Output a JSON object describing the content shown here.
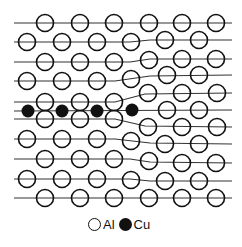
{
  "diagram": {
    "colors": {
      "line": "#333333",
      "atom_outline": "#111111",
      "al_fill": "#ffffff",
      "cu_fill": "#111111"
    },
    "atom_radius": 8.5,
    "cu_radius": 6.5,
    "lattice_lines": [
      {
        "points": [
          [
            14,
            23
          ],
          [
            232,
            23
          ]
        ]
      },
      {
        "points": [
          [
            14,
            42
          ],
          [
            130,
            42
          ],
          [
            150,
            40
          ],
          [
            232,
            40
          ]
        ]
      },
      {
        "points": [
          [
            14,
            62
          ],
          [
            130,
            62
          ],
          [
            150,
            59
          ],
          [
            232,
            59
          ]
        ]
      },
      {
        "points": [
          [
            14,
            81
          ],
          [
            115,
            81
          ],
          [
            150,
            76
          ],
          [
            232,
            75
          ]
        ]
      },
      {
        "points": [
          [
            14,
            102
          ],
          [
            115,
            102
          ],
          [
            145,
            94
          ],
          [
            232,
            93
          ]
        ]
      },
      {
        "points": [
          [
            14,
            111
          ],
          [
            232,
            110
          ]
        ]
      },
      {
        "points": [
          [
            14,
            119
          ],
          [
            115,
            119
          ],
          [
            145,
            126
          ],
          [
            232,
            127
          ]
        ]
      },
      {
        "points": [
          [
            14,
            139
          ],
          [
            115,
            139
          ],
          [
            150,
            143
          ],
          [
            232,
            144
          ]
        ]
      },
      {
        "points": [
          [
            14,
            159
          ],
          [
            130,
            159
          ],
          [
            150,
            162
          ],
          [
            232,
            163
          ]
        ]
      },
      {
        "points": [
          [
            14,
            179
          ],
          [
            130,
            179
          ],
          [
            150,
            181
          ],
          [
            232,
            181
          ]
        ]
      },
      {
        "points": [
          [
            14,
            198
          ],
          [
            232,
            198
          ]
        ]
      }
    ],
    "al_atoms": [
      [
        45,
        23
      ],
      [
        80,
        23
      ],
      [
        114,
        23
      ],
      [
        149,
        23
      ],
      [
        182,
        23
      ],
      [
        216,
        23
      ],
      [
        27,
        42
      ],
      [
        62,
        42
      ],
      [
        97,
        42
      ],
      [
        131,
        42
      ],
      [
        165,
        40
      ],
      [
        199,
        40
      ],
      [
        45,
        62
      ],
      [
        80,
        62
      ],
      [
        114,
        62
      ],
      [
        149,
        60
      ],
      [
        182,
        59
      ],
      [
        216,
        59
      ],
      [
        27,
        81
      ],
      [
        62,
        81
      ],
      [
        97,
        81
      ],
      [
        131,
        79
      ],
      [
        167,
        75
      ],
      [
        199,
        75
      ],
      [
        45,
        102
      ],
      [
        80,
        102
      ],
      [
        114,
        102
      ],
      [
        148,
        93
      ],
      [
        182,
        93
      ],
      [
        217,
        93
      ],
      [
        167,
        110
      ],
      [
        199,
        110
      ],
      [
        45,
        119
      ],
      [
        80,
        119
      ],
      [
        114,
        119
      ],
      [
        148,
        127
      ],
      [
        182,
        127
      ],
      [
        217,
        127
      ],
      [
        27,
        139
      ],
      [
        62,
        139
      ],
      [
        97,
        139
      ],
      [
        131,
        141
      ],
      [
        165,
        144
      ],
      [
        199,
        144
      ],
      [
        45,
        159
      ],
      [
        80,
        159
      ],
      [
        114,
        159
      ],
      [
        149,
        161
      ],
      [
        182,
        163
      ],
      [
        216,
        163
      ],
      [
        27,
        179
      ],
      [
        62,
        179
      ],
      [
        97,
        179
      ],
      [
        131,
        180
      ],
      [
        165,
        181
      ],
      [
        199,
        181
      ],
      [
        45,
        198
      ],
      [
        80,
        198
      ],
      [
        114,
        198
      ],
      [
        149,
        198
      ],
      [
        182,
        198
      ],
      [
        216,
        198
      ]
    ],
    "cu_atoms": [
      [
        28,
        111
      ],
      [
        62,
        111
      ],
      [
        97,
        111
      ],
      [
        132,
        110
      ]
    ]
  },
  "legend": {
    "items": [
      {
        "symbol": "open-circle",
        "label": "Al"
      },
      {
        "symbol": "filled-circle",
        "label": "Cu"
      }
    ]
  }
}
